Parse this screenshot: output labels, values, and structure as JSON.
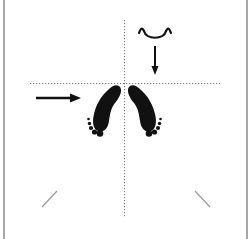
{
  "diagram": {
    "type": "foot-placement-diagram",
    "colors": {
      "background": "#ffffff",
      "ink": "#111111",
      "border": "#8a8a8a",
      "guide": "#777777",
      "hint_line": "#9a9a9a"
    },
    "elements": {
      "vertical_guide": "vertical-dotted-centerline",
      "horizontal_guide": "horizontal-dotted-line",
      "left_arrow": "arrow-right-icon",
      "top_arrow": "arrow-down-icon",
      "head_symbol": "head-curve-icon",
      "left_foot": "left-foot-icon",
      "right_foot": "right-foot-icon",
      "left_diagonal": "diagonal-mark-left",
      "right_diagonal": "diagonal-mark-right"
    }
  }
}
